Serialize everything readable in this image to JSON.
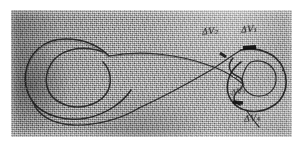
{
  "figure": {
    "medium": "photocopied pencil sketch on grey textured paper",
    "background_color": "#a7a7a7",
    "ink_color": "#1a1a1a",
    "paper_margin_color": "#ffffff",
    "scan_area": {
      "x": 11,
      "y": 10,
      "width": 281,
      "height": 127
    }
  },
  "labels": [
    {
      "id": "dv2",
      "symbol": "ΔV",
      "subscript": "2",
      "text": "ΔV₂",
      "x": 202,
      "y": 26
    },
    {
      "id": "dv1",
      "symbol": "ΔV",
      "subscript": "1",
      "text": "ΔV₁",
      "x": 241,
      "y": 24
    },
    {
      "id": "dv3",
      "symbol": "ΔV",
      "subscript": "3",
      "text": "ΔV₃",
      "x": 231,
      "y": 87
    },
    {
      "id": "dv4",
      "symbol": "ΔV",
      "subscript": "4",
      "text": "ΔV₄",
      "x": 244,
      "y": 113
    }
  ],
  "burn_marks": [
    {
      "id": "burn-upper",
      "description": "thick black arc segment on upper right loop",
      "x": 243,
      "y": 47,
      "length": 13
    },
    {
      "id": "burn-lower",
      "description": "thick black arc segment on lower right loop",
      "x": 235,
      "y": 101,
      "length": 11
    }
  ],
  "strokes": {
    "left_loop": "large rounded closed loop occupying the left third",
    "left_inner_loop": "smaller concentric loop nested inside the left loop",
    "crossing": "two long straight transfer legs crossing near image centre",
    "right_loop": "teardrop shaped loop with inner spiral on the right",
    "right_inner_spiral": "S-shaped spiral entering the centre of the right loop",
    "tail": "short stroke descending from the lower right loop toward ΔV₄"
  }
}
